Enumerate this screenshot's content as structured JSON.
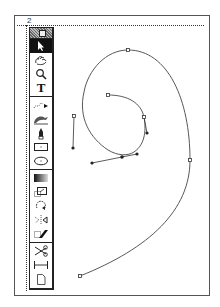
{
  "document": {
    "page_number": "2",
    "colors": {
      "frame": "#555555",
      "path": "#444444",
      "toolbox_border": "#222222",
      "selected_tool_bg": "#111111"
    }
  },
  "toolbox": {
    "tools": [
      {
        "name": "selection-arrow",
        "selected": true
      },
      {
        "name": "grabber-hand",
        "selected": false
      },
      {
        "name": "zoom-magnifier",
        "selected": false
      },
      {
        "name": "text",
        "label": "T",
        "selected": false
      },
      {
        "name": "freehand",
        "selected": false
      },
      {
        "name": "blend-arc",
        "selected": false
      },
      {
        "name": "pen",
        "selected": false
      },
      {
        "name": "rectangle",
        "selected": false
      },
      {
        "name": "ellipse",
        "selected": false
      },
      {
        "name": "gradient-fill",
        "selected": false
      },
      {
        "name": "scale",
        "selected": false
      },
      {
        "name": "rotate",
        "selected": false
      },
      {
        "name": "reflect",
        "selected": false
      },
      {
        "name": "shear",
        "selected": false
      },
      {
        "name": "scissors",
        "selected": false
      },
      {
        "name": "measure",
        "selected": false
      },
      {
        "name": "page",
        "selected": false
      }
    ]
  },
  "path": {
    "anchors": [
      {
        "x": 128,
        "y": 50
      },
      {
        "x": 100,
        "y": 116
      },
      {
        "x": 108,
        "y": 95
      },
      {
        "x": 144,
        "y": 117
      },
      {
        "x": 190,
        "y": 160
      },
      {
        "x": 80,
        "y": 276
      }
    ],
    "handles": [
      {
        "x": 147,
        "y": 133
      },
      {
        "x": 73,
        "y": 148
      },
      {
        "x": 92,
        "y": 163
      },
      {
        "x": 122,
        "y": 157
      },
      {
        "x": 137,
        "y": 154
      }
    ]
  }
}
